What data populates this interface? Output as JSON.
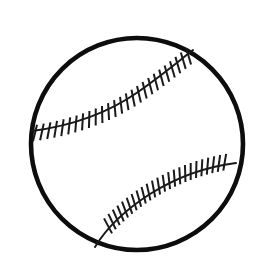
{
  "figure": {
    "title": "Baseball",
    "caption": ""
  },
  "canvas": {
    "width": 263,
    "height": 277,
    "background_color": "#ffffff"
  },
  "colors": {
    "ink": "#111111",
    "outline": "#0d0d0d",
    "seam": "#1a1a1a",
    "fill": "#ffffff"
  },
  "ball": {
    "name": "ball-body",
    "center_x": 137,
    "center_y": 144,
    "radius": 106,
    "outline_width": 4.6,
    "fill_color": "#ffffff",
    "outline_color": "#0d0d0d"
  },
  "seams": [
    {
      "name": "upper-seam",
      "path": "M 32 131 C 70 126 108 113 138 92 C 165 73 180 60 193 50",
      "stroke_width": 2.0,
      "stroke_color": "#1a1a1a",
      "stitch_count": 26,
      "stitch_length": 17,
      "stitch_side": "below",
      "stitch_width": 2.0,
      "stitch_tilt_deg": 22,
      "stitch_start_t": 0.02,
      "stitch_end_t": 0.965
    },
    {
      "name": "lower-seam",
      "path": "M 95 247 C 104 232 122 212 150 194 C 182 174 212 166 236 163",
      "stroke_width": 2.0,
      "stroke_color": "#1a1a1a",
      "stitch_count": 24,
      "stitch_length": 17,
      "stitch_side": "above",
      "stitch_width": 2.0,
      "stitch_tilt_deg": 20,
      "stitch_start_t": 0.14,
      "stitch_end_t": 0.93
    }
  ]
}
